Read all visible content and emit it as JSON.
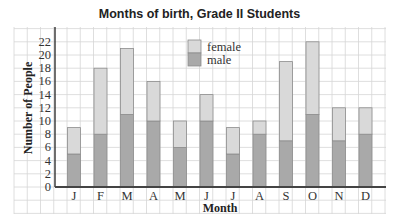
{
  "chart_data": {
    "type": "bar",
    "stacked": true,
    "title": "Months of birth, Grade II Students",
    "xlabel": "Month",
    "ylabel": "Number of People",
    "categories": [
      "J",
      "F",
      "M",
      "A",
      "M",
      "J",
      "J",
      "A",
      "S",
      "O",
      "N",
      "D"
    ],
    "series": [
      {
        "name": "male",
        "color": "#a9a9a9",
        "values": [
          5,
          8,
          11,
          10,
          6,
          10,
          5,
          8,
          7,
          11,
          7,
          8
        ]
      },
      {
        "name": "female",
        "color": "#d9d9d9",
        "values": [
          4,
          10,
          10,
          6,
          4,
          4,
          4,
          2,
          12,
          11,
          5,
          4
        ]
      }
    ],
    "totals": [
      9,
      18,
      21,
      16,
      10,
      14,
      9,
      10,
      19,
      22,
      12,
      12
    ],
    "yticks": [
      "0",
      "2",
      "4",
      "6",
      "8",
      "10",
      "12",
      "14",
      "16",
      "18",
      "20",
      "22"
    ],
    "ylim": [
      0,
      22
    ],
    "grid": true,
    "legend": {
      "position": "top-center-inside",
      "entries": [
        "female",
        "male"
      ]
    }
  }
}
